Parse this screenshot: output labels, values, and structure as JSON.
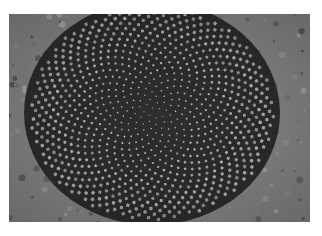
{
  "image": {
    "subject": "Sunflower seed head showing Fibonacci spiral pattern",
    "style": "grayscale photograph",
    "colors": {
      "background": "#ffffff",
      "petal_area": "#8a8a8a",
      "seed_light": "#c8c8c8",
      "seed_dark": "#3a3a3a"
    },
    "center": {
      "x": 143,
      "y": 99
    },
    "seed_count": 900
  }
}
